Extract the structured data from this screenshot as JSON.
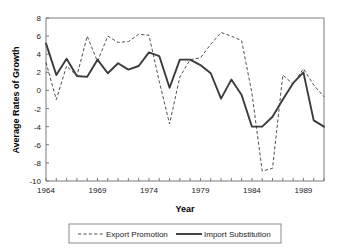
{
  "chart_data": {
    "type": "line",
    "title": "",
    "xlabel": "Year",
    "ylabel": "Average Rates of Growth",
    "xlim": [
      1964,
      1991
    ],
    "ylim": [
      -10,
      8
    ],
    "ytick_step": 2,
    "grid": false,
    "legend_position": "bottom",
    "ytick_labels": [
      "8",
      "6",
      "4",
      "2",
      "0",
      "-2",
      "-4",
      "-6",
      "-8",
      "-10"
    ],
    "ytick_values": [
      8,
      6,
      4,
      2,
      0,
      -2,
      -4,
      -6,
      -8,
      -10
    ],
    "xtick_labels": [
      "1964",
      "1969",
      "1974",
      "1979",
      "1984",
      "1989"
    ],
    "xtick_values": [
      1964,
      1969,
      1974,
      1979,
      1984,
      1989
    ],
    "x": [
      1964,
      1965,
      1966,
      1967,
      1968,
      1969,
      1970,
      1971,
      1972,
      1973,
      1974,
      1975,
      1976,
      1977,
      1978,
      1979,
      1980,
      1981,
      1982,
      1983,
      1984,
      1985,
      1986,
      1987,
      1988,
      1989,
      1990,
      1991
    ],
    "series": [
      {
        "name": "Export Promotion",
        "style": "dashed",
        "color": "#3b3b3b",
        "values": [
          3.1,
          -1.0,
          2.7,
          1.6,
          6.0,
          3.2,
          6.0,
          5.3,
          5.4,
          6.2,
          6.1,
          1.0,
          -3.7,
          1.5,
          3.4,
          3.6,
          5.1,
          6.4,
          6.0,
          5.5,
          -0.3,
          -8.9,
          -8.6,
          1.7,
          0.7,
          2.4,
          0.6,
          -0.7
        ]
      },
      {
        "name": "Import Substitution",
        "style": "solid",
        "color": "#3b3b3b",
        "values": [
          5.2,
          1.7,
          3.5,
          1.6,
          1.5,
          3.4,
          1.9,
          3.0,
          2.3,
          2.7,
          4.2,
          3.8,
          0.3,
          3.4,
          3.4,
          2.8,
          1.9,
          -0.9,
          1.2,
          -0.5,
          -4.0,
          -4.0,
          -2.9,
          -1.0,
          0.8,
          2.0,
          -3.3,
          -4.0
        ]
      }
    ]
  },
  "legend": {
    "entries": [
      {
        "label": "Export Promotion",
        "style": "dashed"
      },
      {
        "label": "Import Substitution",
        "style": "solid"
      }
    ]
  },
  "axes": {
    "x_title": "Year",
    "y_title": "Average Rates of Growth"
  }
}
